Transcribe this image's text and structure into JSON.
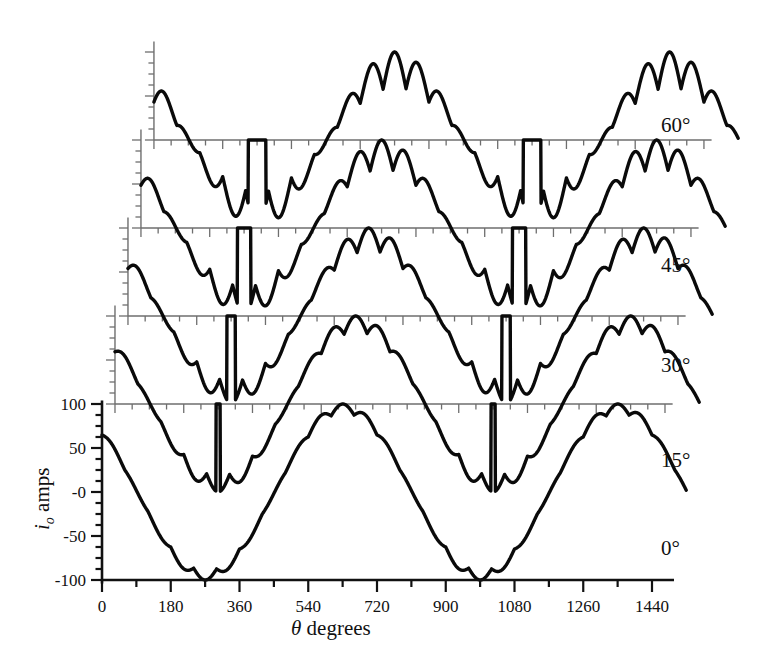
{
  "chart_data": {
    "type": "line",
    "title": "",
    "xlabel": "θ degrees",
    "ylabel": "i_o amps",
    "xlim": [
      0,
      1440
    ],
    "ylim": [
      -100,
      100
    ],
    "xticks": [
      0,
      180,
      360,
      540,
      720,
      900,
      1080,
      1260,
      1440
    ],
    "xtick_labels": [
      "0",
      "180",
      "360",
      "540",
      "720",
      "900",
      "1080",
      "1260",
      "1440"
    ],
    "xminor_step": 90,
    "yticks": [
      -100,
      -50,
      0,
      50,
      100
    ],
    "ytick_labels": [
      "-100",
      "-50",
      "-0",
      "50",
      "100"
    ],
    "yminor_step": 12.5,
    "grid": false,
    "legend_position": "right-of-trace",
    "series_annotation": "Output current waveforms for five thyristor firing-delay angles; traces are vertically and horizontally offset (staircase stacking), each with its own baseline axis.",
    "pulse_number": 6,
    "ripple_period_deg": 60,
    "envelope_period_deg": 720,
    "peak_amplitude": 100,
    "series": [
      {
        "name": "0°",
        "label": "0°",
        "alpha_deg": 0,
        "offset_x_deg": 0,
        "offset_y_amps": 0,
        "start_value": 80,
        "conduction_gap": false,
        "values_summary": "Continuous conduction: full 6-pulse rippled sinusoid, peak +100 to -100, zero crossings near 270 and 990 degrees."
      },
      {
        "name": "15°",
        "label": "15°",
        "alpha_deg": 15,
        "offset_x_deg": 34,
        "offset_y_amps": 100,
        "start_value": 82,
        "conduction_gap": true,
        "values_summary": "Slight clamp at zero on negative half; rectified envelope with 60 degree ripples."
      },
      {
        "name": "30°",
        "label": "30°",
        "alpha_deg": 30,
        "offset_x_deg": 68,
        "offset_y_amps": 200,
        "start_value": 86,
        "conduction_gap": true,
        "values_summary": "Discontinuous conduction: flat zero segments between 300-330 and 1020-1050 degrees."
      },
      {
        "name": "45°",
        "label": "45°",
        "alpha_deg": 45,
        "offset_x_deg": 102,
        "offset_y_amps": 300,
        "start_value": 88,
        "conduction_gap": true,
        "values_summary": "Wider zero-current dwell; deeper ripple troughs approaching zero."
      },
      {
        "name": "60°",
        "label": "60°",
        "alpha_deg": 60,
        "offset_x_deg": 136,
        "offset_y_amps": 400,
        "start_value": 92,
        "conduction_gap": true,
        "values_summary": "Largest zero-current dwell and deepest ripple; discontinuous conduction most pronounced."
      }
    ]
  },
  "axis": {
    "x_axis_label": "θ degrees",
    "x_axis_symbol": "θ",
    "x_axis_word": "degrees",
    "y_axis_symbol": "i",
    "y_axis_subscript": "o",
    "y_axis_unit": "amps"
  },
  "labels": {
    "trace_0": "0°",
    "trace_15": "15°",
    "trace_30": "30°",
    "trace_45": "45°",
    "trace_60": "60°"
  },
  "ytick_text": {
    "t100": "100",
    "t50": "50",
    "t0": "-0",
    "tm50": "-50",
    "tm100": "-100"
  },
  "xtick_text": {
    "t0": "0",
    "t180": "180",
    "t360": "360",
    "t540": "540",
    "t720": "720",
    "t900": "900",
    "t1080": "1080",
    "t1260": "1260",
    "t1440": "1440"
  },
  "colors": {
    "curve": "#0a0a0a",
    "axis_main": "#111111",
    "axis_offset": "#6e6e6e",
    "background": "#ffffff"
  }
}
